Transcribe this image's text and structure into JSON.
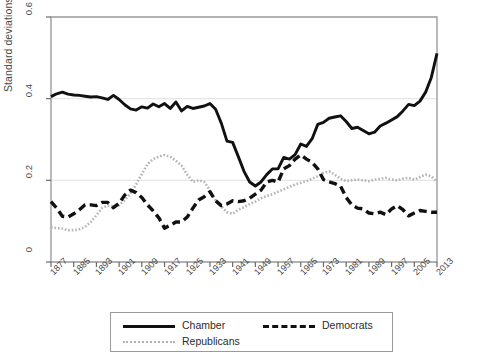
{
  "chart_data": {
    "type": "line",
    "title": "",
    "xlabel": "",
    "ylabel": "Standard deviations",
    "xlim": [
      1877,
      2013
    ],
    "ylim": [
      0,
      0.6
    ],
    "ytick_labels": [
      "0",
      "0.2",
      "0.4",
      "0.6"
    ],
    "ytick_values": [
      0,
      0.2,
      0.4,
      0.6
    ],
    "grid": "horizontal",
    "legend_position": "bottom-center",
    "x": [
      1877,
      1879,
      1881,
      1883,
      1885,
      1887,
      1889,
      1891,
      1893,
      1895,
      1897,
      1899,
      1901,
      1903,
      1905,
      1907,
      1909,
      1911,
      1913,
      1915,
      1917,
      1919,
      1921,
      1923,
      1925,
      1927,
      1929,
      1931,
      1933,
      1935,
      1937,
      1939,
      1941,
      1943,
      1945,
      1947,
      1949,
      1951,
      1953,
      1955,
      1957,
      1959,
      1961,
      1963,
      1965,
      1967,
      1969,
      1971,
      1973,
      1975,
      1977,
      1979,
      1981,
      1983,
      1985,
      1987,
      1989,
      1991,
      1993,
      1995,
      1997,
      1999,
      2001,
      2003,
      2005,
      2007,
      2009,
      2011,
      2013
    ],
    "xtick_labels": [
      "1877",
      "1885",
      "1893",
      "1901",
      "1909",
      "1917",
      "1925",
      "1933",
      "1941",
      "1949",
      "1957",
      "1965",
      "1973",
      "1981",
      "1989",
      "1997",
      "2005",
      "2013"
    ],
    "xtick_values": [
      1877,
      1885,
      1893,
      1901,
      1909,
      1917,
      1925,
      1933,
      1941,
      1949,
      1957,
      1965,
      1973,
      1981,
      1989,
      1997,
      2005,
      2013
    ],
    "series": [
      {
        "name": "Chamber",
        "style": "solid",
        "color": "#111111",
        "values": [
          0.405,
          0.412,
          0.416,
          0.411,
          0.409,
          0.408,
          0.406,
          0.404,
          0.405,
          0.402,
          0.398,
          0.408,
          0.398,
          0.385,
          0.375,
          0.372,
          0.38,
          0.377,
          0.387,
          0.38,
          0.388,
          0.376,
          0.392,
          0.37,
          0.381,
          0.376,
          0.379,
          0.382,
          0.388,
          0.374,
          0.34,
          0.296,
          0.293,
          0.258,
          0.222,
          0.196,
          0.186,
          0.196,
          0.214,
          0.228,
          0.228,
          0.256,
          0.252,
          0.263,
          0.289,
          0.283,
          0.302,
          0.337,
          0.342,
          0.352,
          0.355,
          0.358,
          0.344,
          0.327,
          0.33,
          0.322,
          0.314,
          0.318,
          0.333,
          0.34,
          0.348,
          0.356,
          0.37,
          0.386,
          0.383,
          0.394,
          0.416,
          0.452,
          0.511
        ]
      },
      {
        "name": "Democrats",
        "style": "dashed",
        "color": "#111111",
        "values": [
          0.148,
          0.132,
          0.112,
          0.11,
          0.118,
          0.128,
          0.14,
          0.14,
          0.138,
          0.146,
          0.146,
          0.133,
          0.144,
          0.164,
          0.176,
          0.17,
          0.158,
          0.14,
          0.125,
          0.108,
          0.083,
          0.09,
          0.098,
          0.098,
          0.11,
          0.132,
          0.152,
          0.16,
          0.172,
          0.15,
          0.138,
          0.142,
          0.15,
          0.148,
          0.15,
          0.156,
          0.166,
          0.176,
          0.196,
          0.2,
          0.196,
          0.228,
          0.236,
          0.252,
          0.262,
          0.252,
          0.244,
          0.228,
          0.202,
          0.196,
          0.192,
          0.186,
          0.158,
          0.14,
          0.132,
          0.13,
          0.12,
          0.118,
          0.122,
          0.116,
          0.13,
          0.138,
          0.128,
          0.113,
          0.12,
          0.126,
          0.124,
          0.122,
          0.122
        ]
      },
      {
        "name": "Republicans",
        "style": "dotted",
        "color": "#b4b4b4",
        "values": [
          0.085,
          0.083,
          0.082,
          0.078,
          0.078,
          0.08,
          0.086,
          0.098,
          0.114,
          0.132,
          0.138,
          0.136,
          0.139,
          0.152,
          0.168,
          0.19,
          0.216,
          0.24,
          0.252,
          0.258,
          0.262,
          0.258,
          0.248,
          0.236,
          0.214,
          0.196,
          0.2,
          0.196,
          0.176,
          0.15,
          0.136,
          0.122,
          0.118,
          0.128,
          0.134,
          0.142,
          0.148,
          0.156,
          0.162,
          0.166,
          0.172,
          0.178,
          0.184,
          0.19,
          0.194,
          0.198,
          0.204,
          0.21,
          0.218,
          0.222,
          0.214,
          0.204,
          0.198,
          0.2,
          0.202,
          0.2,
          0.198,
          0.202,
          0.204,
          0.206,
          0.202,
          0.2,
          0.204,
          0.206,
          0.202,
          0.208,
          0.214,
          0.21,
          0.196
        ]
      }
    ],
    "legend": [
      {
        "label": "Chamber",
        "style": "solid"
      },
      {
        "label": "Democrats",
        "style": "dashed"
      },
      {
        "label": "Republicans",
        "style": "dotted"
      }
    ]
  }
}
